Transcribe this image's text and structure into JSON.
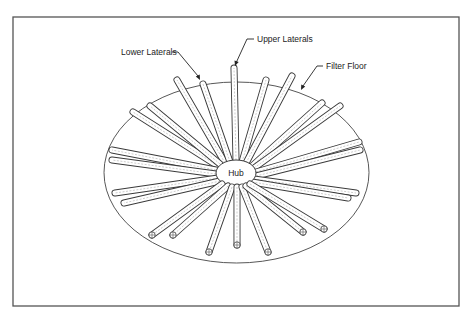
{
  "figure": {
    "frame": {
      "x": 13,
      "y": 17,
      "w": 446,
      "h": 289
    },
    "floor": {
      "cx": 236.5,
      "cy": 172.5,
      "rx": 132.5,
      "ry": 90.5,
      "label": "Filter Floor"
    },
    "hub": {
      "cx": 236,
      "cy": 173,
      "rx": 20,
      "ry": 13,
      "label": "Hub"
    },
    "labels": {
      "upper_laterals": "Upper Laterals",
      "lower_laterals": "Lower Laterals",
      "filter_floor": "Filter Floor"
    },
    "callouts": [
      {
        "key": "upper_laterals",
        "text_x": 257,
        "text_y": 42,
        "path": "M254,39 L247,39 L236,63",
        "tip": [
          235,
          66
        ]
      },
      {
        "key": "lower_laterals",
        "text_x": 121,
        "text_y": 55,
        "path": "M172,52 L178,52 L198,76",
        "tip": [
          200,
          80
        ]
      },
      {
        "key": "filter_floor",
        "text_x": 326,
        "text_y": 69,
        "path": "M323,66 L317,66 L303,86",
        "tip": [
          301,
          90
        ]
      }
    ],
    "laterals_back": [
      {
        "x1": 225,
        "y1": 163,
        "x2": 177,
        "y2": 80
      },
      {
        "x1": 230,
        "y1": 162,
        "x2": 203,
        "y2": 84
      },
      {
        "x1": 236,
        "y1": 160,
        "x2": 234,
        "y2": 68
      },
      {
        "x1": 242,
        "y1": 162,
        "x2": 266,
        "y2": 80
      },
      {
        "x1": 246,
        "y1": 163,
        "x2": 292,
        "y2": 76
      },
      {
        "x1": 218,
        "y1": 166,
        "x2": 133,
        "y2": 112
      },
      {
        "x1": 220,
        "y1": 164,
        "x2": 150,
        "y2": 106
      },
      {
        "x1": 252,
        "y1": 166,
        "x2": 322,
        "y2": 103
      },
      {
        "x1": 254,
        "y1": 168,
        "x2": 340,
        "y2": 106
      },
      {
        "x1": 216,
        "y1": 170,
        "x2": 112,
        "y2": 150
      },
      {
        "x1": 216,
        "y1": 174,
        "x2": 112,
        "y2": 160
      },
      {
        "x1": 256,
        "y1": 172,
        "x2": 359,
        "y2": 142
      },
      {
        "x1": 256,
        "y1": 176,
        "x2": 360,
        "y2": 150
      }
    ],
    "laterals_side": [
      {
        "x1": 218,
        "y1": 178,
        "x2": 115,
        "y2": 193
      },
      {
        "x1": 220,
        "y1": 181,
        "x2": 124,
        "y2": 203
      },
      {
        "x1": 254,
        "y1": 179,
        "x2": 356,
        "y2": 193
      },
      {
        "x1": 252,
        "y1": 182,
        "x2": 348,
        "y2": 198
      }
    ],
    "laterals_front": [
      {
        "x1": 222,
        "y1": 184,
        "x2": 152,
        "y2": 235
      },
      {
        "x1": 228,
        "y1": 186,
        "x2": 173,
        "y2": 235
      },
      {
        "x1": 232,
        "y1": 187,
        "x2": 209,
        "y2": 252
      },
      {
        "x1": 237,
        "y1": 187,
        "x2": 237,
        "y2": 245
      },
      {
        "x1": 242,
        "y1": 187,
        "x2": 268,
        "y2": 252
      },
      {
        "x1": 246,
        "y1": 186,
        "x2": 303,
        "y2": 232
      },
      {
        "x1": 250,
        "y1": 184,
        "x2": 324,
        "y2": 229
      }
    ],
    "pipe_width": 7
  }
}
